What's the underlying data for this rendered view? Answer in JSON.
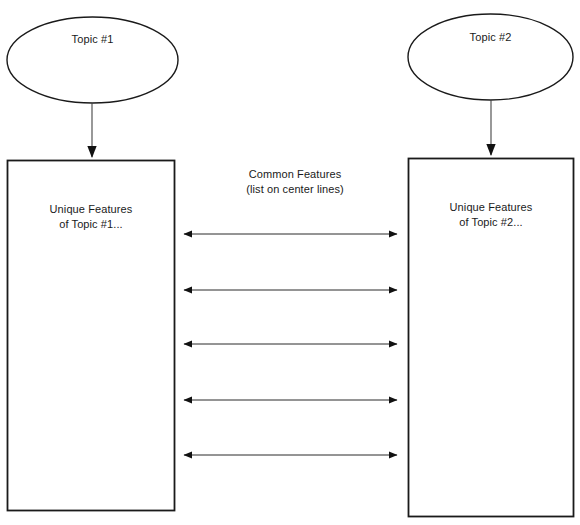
{
  "diagram": {
    "type": "compare-contrast-organizer",
    "background_color": "#ffffff",
    "stroke_color": "#1a1a1a",
    "text_color": "#1a1a1a"
  },
  "topics": [
    {
      "id": "topic-1",
      "ellipse_label": "Topic #1",
      "box_label_line1": "Unique Features",
      "box_label_line2": "of Topic #1..."
    },
    {
      "id": "topic-2",
      "ellipse_label": "Topic #2",
      "box_label_line1": "Unique Features",
      "box_label_line2": "of Topic #2..."
    }
  ],
  "center": {
    "title": "Common Features",
    "subtitle": "(list on center lines)"
  },
  "connectors": {
    "count": 5,
    "style": "double-headed-arrow",
    "rows_y": [
      234,
      290,
      344,
      400,
      455
    ],
    "x_start": 183,
    "x_end": 398
  },
  "topic_connectors": {
    "count": 2,
    "style": "single-headed-arrow-down"
  }
}
